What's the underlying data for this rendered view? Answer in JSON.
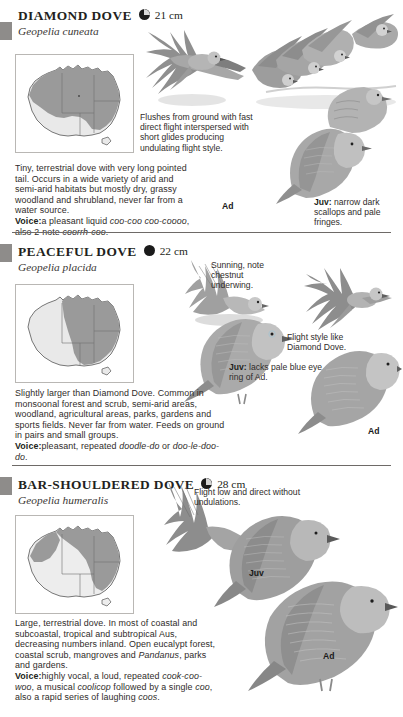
{
  "page": {
    "background": "#ffffff",
    "text_color": "#231f20",
    "tab_color": "#8e8c8a"
  },
  "species": [
    {
      "id": "diamond-dove",
      "common_name": "DIAMOND DOVE",
      "scientific_name": "Geopelia cuneata",
      "size": "21 cm",
      "size_dot": "half-filled-circle",
      "map": {
        "name": "australia-distribution-map",
        "range_color": "#9a9a9a",
        "land_color": "#e9e9e9",
        "border_color": "#6f6f6f"
      },
      "description": "Tiny, terrestrial dove with very long pointed tail. Occurs in a wide variety of arid and semi-arid habitats but mostly dry, grassy woodland and shrubland, never far from a water source.",
      "voice_label": "Voice:",
      "voice_text": "a pleasant liquid ",
      "voice_italic_1": "coo-coo coo-coooo",
      "voice_text_2": ", also 2-note ",
      "voice_italic_2": "coorrh-coo",
      "voice_end": ".",
      "annotations": [
        {
          "name": "flight-note",
          "text": "Flushes from ground with fast direct flight interspersed with short glides producing undulating flight style."
        },
        {
          "name": "juvenile-note",
          "bold": "Juv:",
          "text": " narrow dark scallops and pale fringes."
        }
      ],
      "age_labels": [
        {
          "name": "adult-label",
          "text": "Ad"
        }
      ]
    },
    {
      "id": "peaceful-dove",
      "common_name": "PEACEFUL DOVE",
      "scientific_name": "Geopelia placida",
      "size": "22 cm",
      "size_dot": "filled-circle",
      "map": {
        "name": "australia-distribution-map",
        "range_color": "#9a9a9a",
        "land_color": "#e9e9e9",
        "border_color": "#6f6f6f"
      },
      "description": "Slightly larger than Diamond Dove. Common in monsoonal forest and scrub, semi-arid areas, woodland, agricultural areas, parks, gardens and sports fields. Never far from water. Feeds on ground in pairs and small groups.",
      "voice_label": "Voice:",
      "voice_text": "pleasant, repeated ",
      "voice_italic_1": "doodle-do",
      "voice_text_2": " or ",
      "voice_italic_2": "doo-le-doo-do",
      "voice_end": ".",
      "annotations": [
        {
          "name": "sunning-note",
          "text": "Sunning, note chestnut underwing."
        },
        {
          "name": "flight-style-note",
          "text": "Flight style like Diamond Dove."
        },
        {
          "name": "juvenile-note",
          "bold": "Juv:",
          "text": " lacks pale blue eye ring of Ad."
        }
      ],
      "age_labels": [
        {
          "name": "adult-label",
          "text": "Ad"
        }
      ]
    },
    {
      "id": "bar-shouldered-dove",
      "common_name": "BAR-SHOULDERED DOVE",
      "scientific_name": "Geopelia humeralis",
      "size": "28 cm",
      "size_dot": "half-filled-circle",
      "map": {
        "name": "australia-distribution-map",
        "range_color": "#9a9a9a",
        "land_color": "#e9e9e9",
        "border_color": "#6f6f6f"
      },
      "description": "Large, terrestrial dove. In most of coastal and subcoastal, tropical and subtropical Aus, decreasing numbers inland. Open eucalypt forest, coastal scrub, mangroves and Pandanus, parks and gardens.",
      "description_italic_word": "Pandanus",
      "voice_label": "Voice:",
      "voice_text": "highly vocal, a loud, repeated ",
      "voice_italic_1": "cook-coo-woo",
      "voice_text_2": ", a musical ",
      "voice_italic_2": "coolicop",
      "voice_text_3": " followed by a single ",
      "voice_italic_3": "coo",
      "voice_text_4": ", also a rapid series of laughing ",
      "voice_italic_4": "coos",
      "voice_end": ".",
      "annotations": [
        {
          "name": "flight-note",
          "text": "Flight low and direct without undulations."
        }
      ],
      "age_labels": [
        {
          "name": "juvenile-label",
          "text": "Juv"
        },
        {
          "name": "adult-label",
          "text": "Ad"
        }
      ]
    }
  ]
}
